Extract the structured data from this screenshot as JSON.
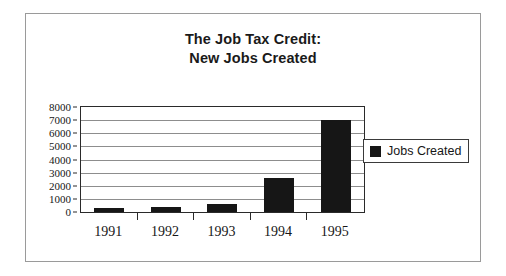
{
  "chart_data": {
    "type": "bar",
    "title": "The Job Tax Credit: New Jobs Created",
    "title_lines": [
      "The Job Tax Credit:",
      "New Jobs Created"
    ],
    "categories": [
      "1991",
      "1992",
      "1993",
      "1994",
      "1995"
    ],
    "values": [
      300,
      380,
      600,
      2600,
      7000
    ],
    "series": [
      {
        "name": "Jobs Created",
        "color": "#161616",
        "values": [
          300,
          380,
          600,
          2600,
          7000
        ]
      }
    ],
    "xlabel": "",
    "ylabel": "",
    "ylim": [
      0,
      8000
    ],
    "y_ticks": [
      8000,
      7000,
      6000,
      5000,
      4000,
      3000,
      2000,
      1000,
      0
    ],
    "y_tick_labels": [
      "8000",
      "7000",
      "6000",
      "5000",
      "4000",
      "3000",
      "2000",
      "1000",
      "0"
    ],
    "grid": true,
    "legend_position": "right",
    "legend_entries": [
      "Jobs Created"
    ],
    "plot_border_color": "#2a2a2a",
    "gridline_color": "#8d8d8d",
    "figure_border_color": "#9a9a9a",
    "background_color": "#ffffff"
  },
  "legend": {
    "label": "Jobs Created"
  }
}
